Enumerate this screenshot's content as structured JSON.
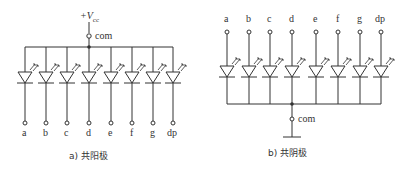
{
  "diagram_a": {
    "supply_label": "+V",
    "supply_subscript": "cc",
    "com_label": "com",
    "segments": [
      "a",
      "b",
      "c",
      "d",
      "e",
      "f",
      "g",
      "dp"
    ],
    "caption": "a) 共阳极"
  },
  "diagram_b": {
    "com_label": "com",
    "segments": [
      "a",
      "b",
      "c",
      "d",
      "e",
      "f",
      "g",
      "dp"
    ],
    "caption": "b) 共阴极"
  }
}
